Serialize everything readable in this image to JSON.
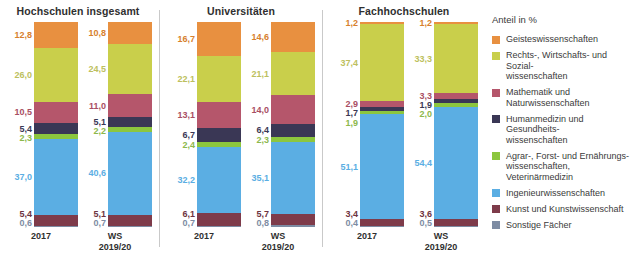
{
  "legend": {
    "title": "Anteil in %",
    "items": [
      {
        "key": "geistes",
        "label": "Geisteswissenschaften",
        "color": "#E89040"
      },
      {
        "key": "recht",
        "label": "Rechts-, Wirtschafts- und Sozial-\nwissenschaften",
        "color": "#C9CF4B"
      },
      {
        "key": "mathe",
        "label": "Mathematik und Naturwissenschaften",
        "color": "#B5566B"
      },
      {
        "key": "human",
        "label": "Humanmedizin und Gesundheits-\nwissenschaften",
        "color": "#3A3755"
      },
      {
        "key": "agrar",
        "label": "Agrar-, Forst- und Ernährungs-\nwissenschaften, Veterinärmedizin",
        "color": "#8CC63E"
      },
      {
        "key": "ingenieur",
        "label": "Ingenieurwissenschaften",
        "color": "#5BAEE3"
      },
      {
        "key": "kunst",
        "label": "Kunst und Kunstwissenschaft",
        "color": "#7E3B4A"
      },
      {
        "key": "sonstige",
        "label": "Sonstige Fächer",
        "color": "#7D8CA3"
      }
    ]
  },
  "panels": [
    {
      "title": "Hochschulen insgesamt",
      "bars": [
        {
          "caption": "2017",
          "values": [
            12.8,
            26.0,
            10.5,
            5.4,
            2.3,
            37.0,
            5.4,
            0.6
          ]
        },
        {
          "caption": "WS\n2019/20",
          "values": [
            10.8,
            24.5,
            11.0,
            5.1,
            2.2,
            40.6,
            5.1,
            0.7
          ]
        }
      ]
    },
    {
      "title": "Universitäten",
      "bars": [
        {
          "caption": "2017",
          "values": [
            16.7,
            22.1,
            13.1,
            6.7,
            2.4,
            32.2,
            6.1,
            0.7
          ]
        },
        {
          "caption": "WS\n2019/20",
          "values": [
            14.6,
            21.1,
            14.0,
            6.4,
            2.3,
            35.1,
            5.7,
            0.8
          ]
        }
      ]
    },
    {
      "title": "Fachhochschulen",
      "bars": [
        {
          "caption": "2017",
          "values": [
            1.2,
            37.4,
            2.9,
            1.7,
            1.9,
            51.1,
            3.4,
            0.4
          ]
        },
        {
          "caption": "WS\n2019/20",
          "values": [
            1.2,
            33.3,
            3.3,
            1.9,
            2.0,
            54.4,
            3.6,
            0.5
          ]
        }
      ]
    }
  ],
  "chart_data": {
    "type": "bar",
    "subtype": "stacked-100-percent",
    "ylabel": "Anteil in %",
    "xlabel": "",
    "ylim": [
      0,
      100
    ],
    "grid": false,
    "legend_position": "right",
    "categories": [
      "Hochschulen insgesamt 2017",
      "Hochschulen insgesamt WS 2019/20",
      "Universitäten 2017",
      "Universitäten WS 2019/20",
      "Fachhochschulen 2017",
      "Fachhochschulen WS 2019/20"
    ],
    "series": [
      {
        "name": "Geisteswissenschaften",
        "color": "#E89040",
        "values": [
          12.8,
          10.8,
          16.7,
          14.6,
          1.2,
          1.2
        ]
      },
      {
        "name": "Rechts-, Wirtschafts- und Sozialwissenschaften",
        "color": "#C9CF4B",
        "values": [
          26.0,
          24.5,
          22.1,
          21.1,
          37.4,
          33.3
        ]
      },
      {
        "name": "Mathematik und Naturwissenschaften",
        "color": "#B5566B",
        "values": [
          10.5,
          11.0,
          13.1,
          14.0,
          2.9,
          3.3
        ]
      },
      {
        "name": "Humanmedizin und Gesundheitswissenschaften",
        "color": "#3A3755",
        "values": [
          5.4,
          5.1,
          6.7,
          6.4,
          1.7,
          1.9
        ]
      },
      {
        "name": "Agrar-, Forst- und Ernährungswissenschaften, Veterinärmedizin",
        "color": "#8CC63E",
        "values": [
          2.3,
          2.2,
          2.4,
          2.3,
          1.9,
          2.0
        ]
      },
      {
        "name": "Ingenieurwissenschaften",
        "color": "#5BAEE3",
        "values": [
          37.0,
          40.6,
          32.2,
          35.1,
          51.1,
          54.4
        ]
      },
      {
        "name": "Kunst und Kunstwissenschaft",
        "color": "#7E3B4A",
        "values": [
          5.4,
          5.1,
          6.1,
          5.7,
          3.4,
          3.6
        ]
      },
      {
        "name": "Sonstige Fächer",
        "color": "#7D8CA3",
        "values": [
          0.6,
          0.7,
          0.7,
          0.8,
          0.4,
          0.5
        ]
      }
    ]
  }
}
